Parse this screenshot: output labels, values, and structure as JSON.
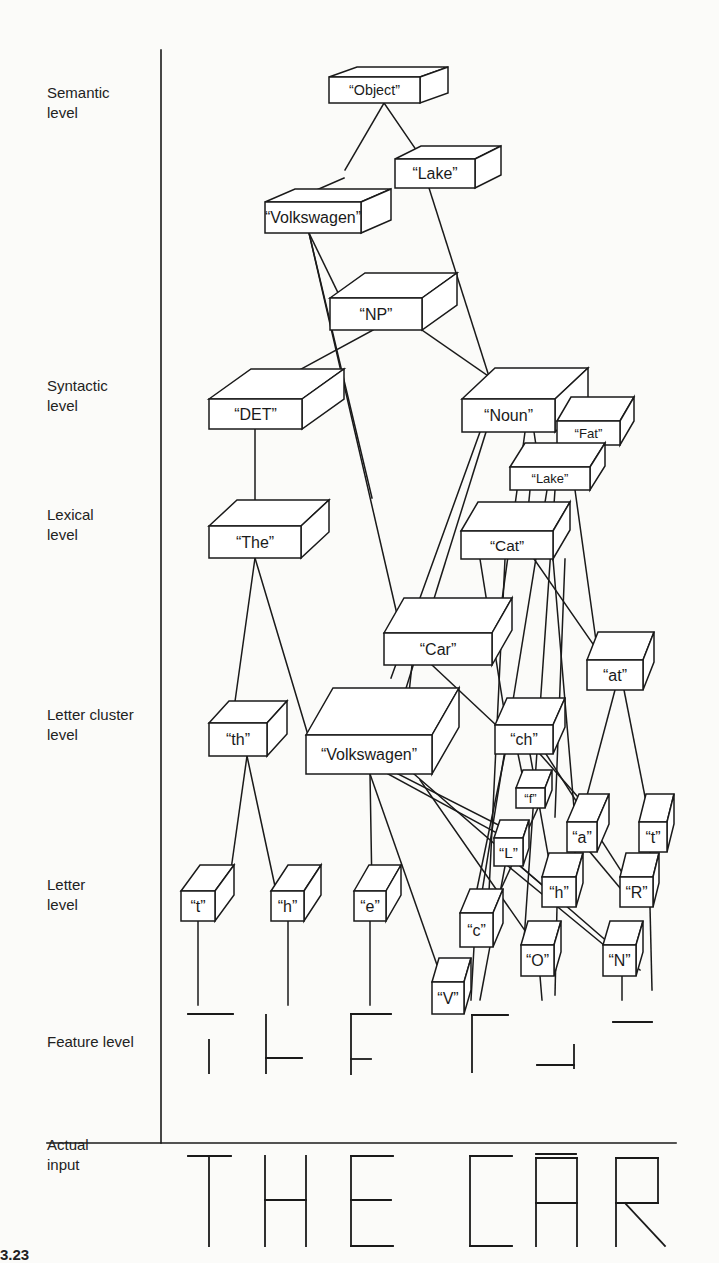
{
  "figure": {
    "number_partial": "3.23",
    "levels": [
      {
        "id": "semantic",
        "label": "Semantic level",
        "lines": [
          "Semantic",
          "level"
        ],
        "y": 103
      },
      {
        "id": "syntactic",
        "label": "Syntactic level",
        "lines": [
          "Syntactic",
          "level"
        ],
        "y": 396
      },
      {
        "id": "lexical",
        "label": "Lexical level",
        "lines": [
          "Lexical",
          "level"
        ],
        "y": 525
      },
      {
        "id": "letter-cluster",
        "label": "Letter cluster level",
        "lines": [
          "Letter cluster",
          "level"
        ],
        "y": 725
      },
      {
        "id": "letter",
        "label": "Letter level",
        "lines": [
          "Letter",
          "level"
        ],
        "y": 895
      },
      {
        "id": "feature",
        "label": "Feature level",
        "lines": [
          "Feature level"
        ],
        "y": 1042
      },
      {
        "id": "actual-input",
        "label": "Actual input",
        "lines": [
          "Actual",
          "input"
        ],
        "y": 1155
      }
    ],
    "colors": {
      "ink": "#1a1a1a",
      "paper": "#fbfbf9",
      "box_fill": "#ffffff"
    },
    "axis": {
      "vertical_x": 161,
      "vertical_top": 50,
      "vertical_bottom": 1143,
      "horizontal_y": 1143,
      "horizontal_x1": 47,
      "horizontal_x2": 676
    },
    "nodes": [
      {
        "id": "object",
        "label": "“Object”",
        "x": 329,
        "y": 77,
        "w": 91,
        "h": 26,
        "dx": 28,
        "dy": 10
      },
      {
        "id": "lake-sem",
        "label": "“Lake”",
        "x": 395,
        "y": 159,
        "w": 80,
        "h": 29,
        "dx": 26,
        "dy": 13
      },
      {
        "id": "volkswagen-sem",
        "label": "“Volkswagen”",
        "x": 265,
        "y": 202,
        "w": 96,
        "h": 31,
        "dx": 30,
        "dy": 13
      },
      {
        "id": "np",
        "label": "“NP”",
        "x": 330,
        "y": 298,
        "w": 92,
        "h": 32,
        "dx": 35,
        "dy": 25
      },
      {
        "id": "det",
        "label": "“DET”",
        "x": 209,
        "y": 399,
        "w": 93,
        "h": 30,
        "dx": 42,
        "dy": 30
      },
      {
        "id": "noun",
        "label": "“Noun”",
        "x": 462,
        "y": 399,
        "w": 93,
        "h": 33,
        "dx": 33,
        "dy": 31
      },
      {
        "id": "fat",
        "label": "“Fat”",
        "x": 557,
        "y": 421,
        "w": 63,
        "h": 24,
        "dx": 14,
        "dy": 24
      },
      {
        "id": "lake-lex",
        "label": "“Lake”",
        "x": 510,
        "y": 467,
        "w": 80,
        "h": 23,
        "dx": 15,
        "dy": 24
      },
      {
        "id": "the",
        "label": "“The”",
        "x": 209,
        "y": 526,
        "w": 92,
        "h": 32,
        "dx": 28,
        "dy": 26
      },
      {
        "id": "cat",
        "label": "“Cat”",
        "x": 461,
        "y": 531,
        "w": 92,
        "h": 28,
        "dx": 17,
        "dy": 29
      },
      {
        "id": "car",
        "label": "“Car”",
        "x": 384,
        "y": 633,
        "w": 108,
        "h": 32,
        "dx": 20,
        "dy": 35
      },
      {
        "id": "at",
        "label": "“at”",
        "x": 587,
        "y": 660,
        "w": 56,
        "h": 30,
        "dx": 11,
        "dy": 28
      },
      {
        "id": "th",
        "label": "“th”",
        "x": 209,
        "y": 723,
        "w": 58,
        "h": 33,
        "dx": 20,
        "dy": 22
      },
      {
        "id": "volkswagen-cl",
        "label": "“Volkswagen”",
        "x": 306,
        "y": 735,
        "w": 126,
        "h": 39,
        "dx": 27,
        "dy": 47
      },
      {
        "id": "ch",
        "label": "“ch”",
        "x": 495,
        "y": 725,
        "w": 58,
        "h": 29,
        "dx": 12,
        "dy": 27
      },
      {
        "id": "f",
        "label": "“f”",
        "x": 516,
        "y": 788,
        "w": 29,
        "h": 20,
        "dx": 7,
        "dy": 18
      },
      {
        "id": "a",
        "label": "“a”",
        "x": 567,
        "y": 822,
        "w": 30,
        "h": 30,
        "dx": 12,
        "dy": 28
      },
      {
        "id": "t2",
        "label": "“t”",
        "x": 639,
        "y": 822,
        "w": 28,
        "h": 30,
        "dx": 7,
        "dy": 28
      },
      {
        "id": "l",
        "label": "“L”",
        "x": 494,
        "y": 838,
        "w": 29,
        "h": 28,
        "dx": 6,
        "dy": 18
      },
      {
        "id": "t",
        "label": "“t”",
        "x": 181,
        "y": 891,
        "w": 34,
        "h": 30,
        "dx": 19,
        "dy": 26
      },
      {
        "id": "h",
        "label": "“h”",
        "x": 271,
        "y": 891,
        "w": 33,
        "h": 30,
        "dx": 17,
        "dy": 26
      },
      {
        "id": "e",
        "label": "“e”",
        "x": 354,
        "y": 891,
        "w": 32,
        "h": 30,
        "dx": 15,
        "dy": 26
      },
      {
        "id": "h2",
        "label": "“h”",
        "x": 542,
        "y": 877,
        "w": 34,
        "h": 30,
        "dx": 7,
        "dy": 24
      },
      {
        "id": "r",
        "label": "“R”",
        "x": 620,
        "y": 877,
        "w": 33,
        "h": 30,
        "dx": 6,
        "dy": 24
      },
      {
        "id": "c",
        "label": "“c”",
        "x": 460,
        "y": 913,
        "w": 33,
        "h": 34,
        "dx": 10,
        "dy": 24
      },
      {
        "id": "o",
        "label": "“O”",
        "x": 521,
        "y": 945,
        "w": 33,
        "h": 31,
        "dx": 7,
        "dy": 24
      },
      {
        "id": "n",
        "label": "“N”",
        "x": 603,
        "y": 945,
        "w": 33,
        "h": 31,
        "dx": 7,
        "dy": 24
      },
      {
        "id": "v",
        "label": "“V”",
        "x": 432,
        "y": 982,
        "w": 32,
        "h": 32,
        "dx": 7,
        "dy": 24
      }
    ],
    "edges": [
      [
        384,
        103,
        345,
        170
      ],
      [
        384,
        103,
        421,
        157
      ],
      [
        344,
        178,
        289,
        202
      ],
      [
        429,
        188,
        500,
        411
      ],
      [
        309,
        233,
        341,
        299
      ],
      [
        309,
        233,
        372,
        498
      ],
      [
        309,
        233,
        402,
        636
      ],
      [
        373,
        330,
        292,
        374
      ],
      [
        422,
        330,
        520,
        398
      ],
      [
        255,
        429,
        255,
        526
      ],
      [
        480,
        432,
        391,
        678
      ],
      [
        486,
        432,
        393,
        730
      ],
      [
        525,
        432,
        499,
        622
      ],
      [
        534,
        432,
        537,
        452
      ],
      [
        570,
        445,
        570,
        467
      ],
      [
        255,
        558,
        232,
        723
      ],
      [
        255,
        558,
        308,
        735
      ],
      [
        547,
        490,
        478,
        917
      ],
      [
        555,
        490,
        523,
        955
      ],
      [
        575,
        490,
        598,
        655
      ],
      [
        530,
        490,
        526,
        531
      ],
      [
        505,
        559,
        488,
        913
      ],
      [
        480,
        559,
        505,
        716
      ],
      [
        534,
        559,
        602,
        657
      ],
      [
        565,
        559,
        555,
        817
      ],
      [
        553,
        559,
        575,
        820
      ],
      [
        412,
        665,
        404,
        740
      ],
      [
        432,
        665,
        496,
        725
      ],
      [
        247,
        756,
        228,
        891
      ],
      [
        247,
        756,
        276,
        891
      ],
      [
        370,
        774,
        372,
        891
      ],
      [
        370,
        774,
        443,
        982
      ],
      [
        388,
        774,
        506,
        838
      ],
      [
        398,
        774,
        524,
        838
      ],
      [
        414,
        774,
        640,
        970
      ],
      [
        505,
        754,
        472,
        913
      ],
      [
        518,
        754,
        525,
        788
      ],
      [
        530,
        754,
        552,
        877
      ],
      [
        540,
        754,
        600,
        822
      ],
      [
        546,
        754,
        625,
        877
      ],
      [
        615,
        690,
        580,
        822
      ],
      [
        624,
        690,
        650,
        822
      ],
      [
        538,
        808,
        490,
        913
      ],
      [
        505,
        866,
        480,
        1000
      ],
      [
        520,
        866,
        560,
        900
      ],
      [
        575,
        852,
        575,
        877
      ],
      [
        590,
        852,
        620,
        888
      ],
      [
        650,
        852,
        650,
        877
      ],
      [
        420,
        780,
        535,
        945
      ],
      [
        508,
        866,
        610,
        950
      ],
      [
        198,
        921,
        198,
        1005
      ],
      [
        288,
        921,
        288,
        1005
      ],
      [
        370,
        921,
        370,
        1005
      ],
      [
        474,
        947,
        471,
        1000
      ],
      [
        540,
        976,
        542,
        1000
      ],
      [
        622,
        976,
        622,
        1000
      ],
      [
        650,
        907,
        652,
        990
      ],
      [
        557,
        907,
        555,
        995
      ]
    ],
    "features": {
      "segments": [
        [
          188,
          1014,
          233,
          1014
        ],
        [
          209,
          1040,
          209,
          1073
        ],
        [
          266,
          1015,
          266,
          1073
        ],
        [
          266,
          1058,
          302,
          1058
        ],
        [
          351,
          1014,
          391,
          1014
        ],
        [
          351,
          1014,
          351,
          1074
        ],
        [
          351,
          1059,
          371,
          1059
        ],
        [
          472,
          1015,
          508,
          1015
        ],
        [
          472,
          1015,
          472,
          1072
        ],
        [
          537,
          1065,
          574,
          1065
        ],
        [
          574,
          1045,
          574,
          1068
        ],
        [
          613,
          1022,
          652,
          1022
        ]
      ]
    },
    "actual_input": {
      "text": "THE CAR",
      "segments": [
        [
          188,
          1156,
          231,
          1156
        ],
        [
          209,
          1156,
          209,
          1246
        ],
        [
          265,
          1156,
          265,
          1246
        ],
        [
          306,
          1156,
          306,
          1246
        ],
        [
          265,
          1200,
          306,
          1200
        ],
        [
          351,
          1156,
          393,
          1156
        ],
        [
          351,
          1156,
          351,
          1246
        ],
        [
          351,
          1200,
          391,
          1200
        ],
        [
          351,
          1246,
          393,
          1246
        ],
        [
          470,
          1156,
          512,
          1156
        ],
        [
          470,
          1156,
          470,
          1246
        ],
        [
          470,
          1246,
          512,
          1246
        ],
        [
          536,
          1158,
          577,
          1158
        ],
        [
          536,
          1158,
          536,
          1246
        ],
        [
          577,
          1158,
          577,
          1246
        ],
        [
          536,
          1203,
          577,
          1203
        ],
        [
          536,
          1154,
          576,
          1154
        ],
        [
          616,
          1158,
          658,
          1158
        ],
        [
          616,
          1158,
          616,
          1246
        ],
        [
          658,
          1158,
          658,
          1203
        ],
        [
          616,
          1203,
          658,
          1203
        ],
        [
          625,
          1203,
          665,
          1246
        ]
      ]
    }
  }
}
